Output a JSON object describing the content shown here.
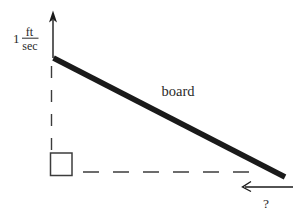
{
  "diagram": {
    "rate_label": {
      "coefficient": "1",
      "numerator": "ft",
      "denominator": "sec"
    },
    "board_label": "board",
    "unknown_rate_label": "?"
  },
  "colors": {
    "ink": "#1a1a1a",
    "line": "#3c3c3c",
    "text": "#2a2a2a",
    "background": "#ffffff"
  }
}
